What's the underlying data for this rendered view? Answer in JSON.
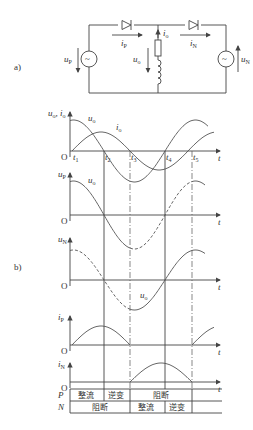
{
  "panel_labels": {
    "a": "a)",
    "b": "b)"
  },
  "circuit": {
    "source_left": "u",
    "source_left_sub": "P",
    "source_right": "u",
    "source_right_sub": "N",
    "current_p": "i",
    "current_p_sub": "P",
    "current_n": "i",
    "current_n_sub": "N",
    "current_o": "i",
    "current_o_sub": "o",
    "voltage_o": "u",
    "voltage_o_sub": "o",
    "source_glyph": "~"
  },
  "waveforms": {
    "origin_label": "O",
    "time_label": "t",
    "time_marks": [
      "t1",
      "t2",
      "t3",
      "t4",
      "t5"
    ],
    "time_mark_base": "t",
    "time_mark_subs": [
      "1",
      "2",
      "3",
      "4",
      "5"
    ],
    "panels": [
      {
        "ylabel": "u",
        "ylabel_sub": "o",
        "ylabel2": "i",
        "ylabel2_sub": "o",
        "curve_labels": [
          {
            "t": "u",
            "s": "o"
          },
          {
            "t": "i",
            "s": "o"
          }
        ]
      },
      {
        "ylabel": "u",
        "ylabel_sub": "P",
        "curve_labels": [
          {
            "t": "u",
            "s": "o"
          }
        ]
      },
      {
        "ylabel": "u",
        "ylabel_sub": "N",
        "curve_labels": [
          {
            "t": "u",
            "s": "o"
          }
        ]
      },
      {
        "ylabel": "i",
        "ylabel_sub": "P"
      },
      {
        "ylabel": "i",
        "ylabel_sub": "N"
      }
    ]
  },
  "state_table": {
    "rows": [
      {
        "name": "P",
        "cells": [
          "整流",
          "逆变",
          "阻断"
        ]
      },
      {
        "name": "N",
        "cells": [
          "阻断",
          "整流",
          "逆变"
        ]
      }
    ]
  }
}
